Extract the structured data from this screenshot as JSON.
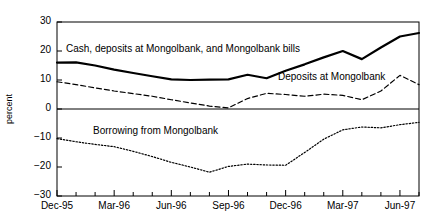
{
  "chart_data": {
    "type": "line",
    "title": "",
    "subtitle": "",
    "xlabel": "",
    "ylabel": "percent",
    "ylim": [
      -30,
      30
    ],
    "yticks": [
      30,
      20,
      10,
      0,
      -10,
      -20,
      -30
    ],
    "ytick_labels": [
      "30",
      "20",
      "10",
      "0",
      "−10",
      "−20",
      "−30"
    ],
    "xtick_labels": [
      "Dec-95",
      "Mar-96",
      "Jun-96",
      "Sep-96",
      "Dec-96",
      "Mar-97",
      "Jun-97"
    ],
    "xtick_indices": [
      0,
      3,
      6,
      9,
      12,
      15,
      18
    ],
    "x": [
      "Dec-95",
      "Jan-96",
      "Feb-96",
      "Mar-96",
      "Apr-96",
      "May-96",
      "Jun-96",
      "Jul-96",
      "Aug-96",
      "Sep-96",
      "Oct-96",
      "Nov-96",
      "Dec-96",
      "Jan-97",
      "Feb-97",
      "Mar-97",
      "Apr-97",
      "May-97",
      "Jun-97",
      "Jul-97"
    ],
    "grid": false,
    "legend_position": "inline-annotations",
    "zero_line": true,
    "series": [
      {
        "name": "Cash, deposits at Mongolbank, and Mongolbank bills",
        "style": "solid",
        "color": "#000000",
        "width": 2.2,
        "values": [
          16.0,
          16.1,
          15.0,
          13.6,
          12.4,
          11.3,
          10.2,
          10.0,
          10.1,
          10.2,
          11.8,
          10.6,
          13.2,
          15.4,
          17.8,
          20.0,
          17.2,
          21.2,
          25.0,
          26.2
        ]
      },
      {
        "name": "Deposits at Mongolbank",
        "style": "dashed",
        "color": "#000000",
        "width": 1.2,
        "values": [
          9.4,
          8.4,
          7.3,
          6.2,
          5.3,
          4.4,
          3.2,
          2.1,
          1.0,
          0.4,
          3.6,
          5.4,
          5.0,
          4.4,
          5.1,
          4.7,
          3.2,
          6.2,
          11.6,
          8.4
        ]
      },
      {
        "name": "Borrowing from Mongolbank",
        "style": "dotted",
        "color": "#000000",
        "width": 1.2,
        "values": [
          -10.2,
          -11.3,
          -12.2,
          -13.0,
          -14.6,
          -16.4,
          -18.4,
          -20.0,
          -21.8,
          -19.8,
          -19.0,
          -19.3,
          -19.4,
          -15.0,
          -10.4,
          -7.2,
          -6.2,
          -6.5,
          -5.4,
          -4.6
        ]
      }
    ],
    "annotations": [
      {
        "name": "cash-deposits-bills-label",
        "text": "Cash, deposits at Mongolbank, and Mongolbank bills",
        "x_px": 66,
        "y_px": 43
      },
      {
        "name": "deposits-at-mongolbank-label",
        "text": "Deposits at Mongolbank",
        "x_px": 278,
        "y_px": 71
      },
      {
        "name": "borrowing-from-mongolbank-label",
        "text": "Borrowing from Mongolbank",
        "x_px": 93,
        "y_px": 125
      }
    ]
  },
  "plot_geometry": {
    "left_px": 57,
    "right_px": 419,
    "top_px": 22,
    "bottom_px": 196
  }
}
